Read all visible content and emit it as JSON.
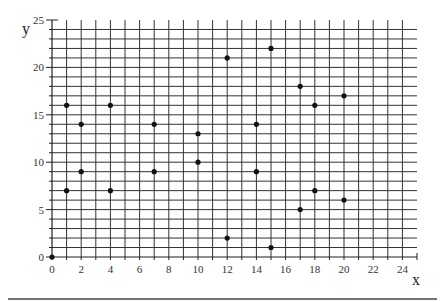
{
  "chart_data": {
    "type": "scatter",
    "title": "",
    "xlabel": "x",
    "ylabel": "y",
    "xlim": [
      0,
      25
    ],
    "ylim": [
      0,
      25
    ],
    "grid": true,
    "grid_step": 1,
    "x_ticks": [
      0,
      2,
      4,
      6,
      8,
      10,
      12,
      14,
      16,
      18,
      20,
      22,
      24
    ],
    "y_ticks": [
      0,
      5,
      10,
      15,
      20,
      25
    ],
    "legend": null,
    "series": [
      {
        "name": "points",
        "points": [
          {
            "x": 0,
            "y": 0
          },
          {
            "x": 1,
            "y": 16
          },
          {
            "x": 1,
            "y": 7
          },
          {
            "x": 2,
            "y": 14
          },
          {
            "x": 2,
            "y": 9
          },
          {
            "x": 4,
            "y": 16
          },
          {
            "x": 4,
            "y": 7
          },
          {
            "x": 7,
            "y": 14
          },
          {
            "x": 7,
            "y": 9
          },
          {
            "x": 10,
            "y": 13
          },
          {
            "x": 10,
            "y": 10
          },
          {
            "x": 12,
            "y": 21
          },
          {
            "x": 12,
            "y": 2
          },
          {
            "x": 14,
            "y": 14
          },
          {
            "x": 14,
            "y": 9
          },
          {
            "x": 15,
            "y": 22
          },
          {
            "x": 15,
            "y": 1
          },
          {
            "x": 17,
            "y": 18
          },
          {
            "x": 17,
            "y": 5
          },
          {
            "x": 18,
            "y": 16
          },
          {
            "x": 18,
            "y": 7
          },
          {
            "x": 20,
            "y": 17
          },
          {
            "x": 20,
            "y": 6
          }
        ]
      }
    ]
  },
  "colors": {
    "grid": "#333333",
    "point": "#111111",
    "rule": "#444444"
  }
}
